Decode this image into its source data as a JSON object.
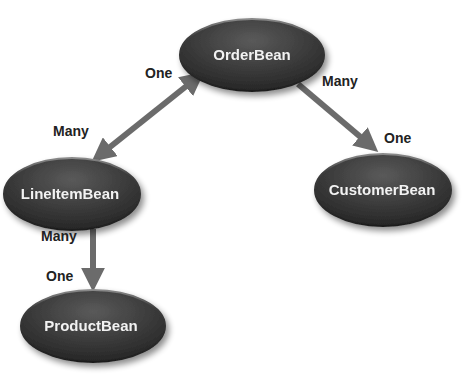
{
  "diagram": {
    "type": "entity-relationship",
    "colors": {
      "background": "#ffffff",
      "node_fill_dark": "#2e2e2e",
      "node_fill_light": "#6a6a6a",
      "node_text": "#f2f2f2",
      "arrow": "#6b6b6b",
      "label_text": "#222222"
    },
    "nodes": [
      {
        "id": "order",
        "label": "OrderBean"
      },
      {
        "id": "lineitem",
        "label": "LineItemBean"
      },
      {
        "id": "customer",
        "label": "CustomerBean"
      },
      {
        "id": "product",
        "label": "ProductBean"
      }
    ],
    "edges": [
      {
        "from": "order",
        "to": "lineitem",
        "direction": "both",
        "from_label": "One",
        "to_label": "Many"
      },
      {
        "from": "order",
        "to": "customer",
        "direction": "forward",
        "from_label": "Many",
        "to_label": "One"
      },
      {
        "from": "lineitem",
        "to": "product",
        "direction": "forward",
        "from_label": "Many",
        "to_label": "One"
      }
    ]
  }
}
